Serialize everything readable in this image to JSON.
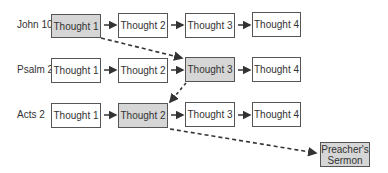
{
  "rows": [
    {
      "label": "John 10",
      "thoughts": [
        "Thought 1",
        "Thought 2",
        "Thought 3",
        "Thought 4"
      ],
      "highlighted": 0
    },
    {
      "label": "Psalm 23",
      "thoughts": [
        "Thought 1",
        "Thought 2",
        "Thought 3",
        "Thought 4"
      ],
      "highlighted": 2
    },
    {
      "label": "Acts 2",
      "thoughts": [
        "Thought 1",
        "Thought 2",
        "Thought 3",
        "Thought 4"
      ],
      "highlighted": 1
    }
  ],
  "sermon": {
    "line1": "Preacher's",
    "line2": "Sermon"
  },
  "colors": {
    "highlight_fill": "#d6d6d6",
    "box_border": "#555555",
    "arrow": "#333333"
  }
}
